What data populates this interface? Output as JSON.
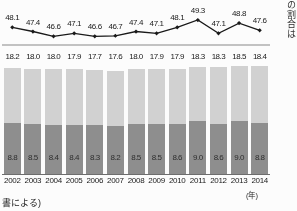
{
  "chart_data": {
    "type": "bar",
    "title": "",
    "subtitle": "",
    "xlabel": "(年)",
    "ylabel": "",
    "grid": false,
    "legend_position": "none",
    "categories": [
      "2002",
      "2003",
      "2004",
      "2005",
      "2006",
      "2007",
      "2008",
      "2009",
      "2010",
      "2011",
      "2012",
      "2013",
      "2014"
    ],
    "series": [
      {
        "name": "line-series",
        "chart_type": "line",
        "panel": "upper",
        "marker": "filled-diamond",
        "color": "#151515",
        "values": [
          48.1,
          47.4,
          46.6,
          47.1,
          46.6,
          46.7,
          47.4,
          47.1,
          48.1,
          49.3,
          47.1,
          48.8,
          47.6
        ]
      },
      {
        "name": "bar-total-upper-label",
        "chart_type": "bar-label",
        "panel": "lower",
        "position": "above-bar",
        "values": [
          18.2,
          18.0,
          18.0,
          17.9,
          17.7,
          17.6,
          18.0,
          17.9,
          17.9,
          18.3,
          18.3,
          18.5,
          18.4
        ]
      },
      {
        "name": "bar-lower-segment",
        "chart_type": "bar-segment",
        "panel": "lower",
        "color": "#8d8d8d",
        "values": [
          8.8,
          8.5,
          8.4,
          8.4,
          8.3,
          8.2,
          8.5,
          8.5,
          8.6,
          9.0,
          8.6,
          9.0,
          8.8
        ]
      }
    ],
    "line_ylim": [
      46.0,
      49.8
    ],
    "bar_ylim": [
      0,
      18.8
    ]
  },
  "axis": {
    "unit_label": "(年)"
  },
  "notes": {
    "source_fragment": "書による)"
  },
  "vertical_text": {
    "column": "の割合は"
  },
  "colors": {
    "bar_upper": "#d2d2d2",
    "bar_lower": "#8d8d8d",
    "line": "#151515",
    "separator": "#c3c3c3",
    "baseline": "#6b6b6b"
  }
}
